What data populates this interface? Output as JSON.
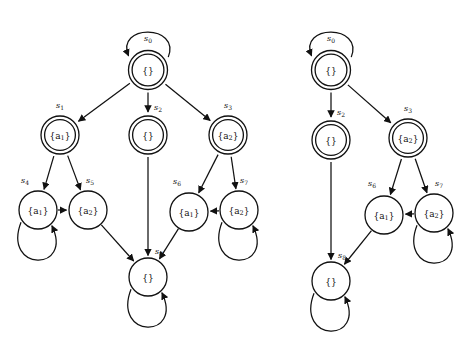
{
  "figure": {
    "title": "",
    "background_color": "#ffffff",
    "stroke_color": "#111111",
    "width": 472,
    "height": 339
  },
  "diagrams": [
    {
      "name": "left-automaton",
      "nodes": [
        {
          "id": "s0",
          "state_label": "s",
          "state_sub": "0",
          "set_label": "{}",
          "set_main": "{}",
          "set_sub": "",
          "cx": 148,
          "cy": 70,
          "r": 19.5,
          "double": true,
          "self_loop": "top",
          "state_label_x": 148,
          "state_label_y": 38
        },
        {
          "id": "s1",
          "state_label": "s",
          "state_sub": "1",
          "set_label": "{a1}",
          "set_main": "{a",
          "set_sub": "1",
          "cx": 60,
          "cy": 135,
          "r": 19,
          "double": true,
          "self_loop": "",
          "state_label_x": 60,
          "state_label_y": 105
        },
        {
          "id": "s2",
          "state_label": "s",
          "state_sub": "2",
          "set_label": "{}",
          "set_main": "{}",
          "set_sub": "",
          "cx": 148,
          "cy": 135,
          "r": 19,
          "double": true,
          "self_loop": "",
          "state_label_x": 158,
          "state_label_y": 107
        },
        {
          "id": "s3",
          "state_label": "s",
          "state_sub": "3",
          "set_label": "{a2}",
          "set_main": "{a",
          "set_sub": "2",
          "cx": 228,
          "cy": 135,
          "r": 19,
          "double": true,
          "self_loop": "",
          "state_label_x": 228,
          "state_label_y": 105
        },
        {
          "id": "s4",
          "state_label": "s",
          "state_sub": "4",
          "set_label": "{a1}",
          "set_main": "{a",
          "set_sub": "1",
          "cx": 38,
          "cy": 210,
          "r": 19,
          "double": false,
          "self_loop": "bottom",
          "state_label_x": 25,
          "state_label_y": 180
        },
        {
          "id": "s5",
          "state_label": "s",
          "state_sub": "5",
          "set_label": "{a2}",
          "set_main": "{a",
          "set_sub": "2",
          "cx": 88,
          "cy": 210,
          "r": 19,
          "double": false,
          "self_loop": "",
          "state_label_x": 90,
          "state_label_y": 180
        },
        {
          "id": "s6",
          "state_label": "s",
          "state_sub": "6",
          "set_label": "{a1}",
          "set_main": "{a",
          "set_sub": "1",
          "cx": 189,
          "cy": 212,
          "r": 19,
          "double": false,
          "self_loop": "",
          "state_label_x": 177,
          "state_label_y": 181
        },
        {
          "id": "s7",
          "state_label": "s",
          "state_sub": "7",
          "set_label": "{a2}",
          "set_main": "{a",
          "set_sub": "2",
          "cx": 239,
          "cy": 210,
          "r": 19,
          "double": false,
          "self_loop": "bottom",
          "state_label_x": 244,
          "state_label_y": 180
        },
        {
          "id": "s8",
          "state_label": "s",
          "state_sub": "8",
          "set_label": "{}",
          "set_main": "{}",
          "set_sub": "",
          "cx": 148,
          "cy": 277,
          "r": 19,
          "double": false,
          "self_loop": "bottom",
          "state_label_x": 159,
          "state_label_y": 251
        }
      ],
      "edges": [
        {
          "from": "s0",
          "to": "s1"
        },
        {
          "from": "s0",
          "to": "s2"
        },
        {
          "from": "s0",
          "to": "s3"
        },
        {
          "from": "s1",
          "to": "s4"
        },
        {
          "from": "s1",
          "to": "s5"
        },
        {
          "from": "s3",
          "to": "s6"
        },
        {
          "from": "s3",
          "to": "s7"
        },
        {
          "from": "s4",
          "to": "s5"
        },
        {
          "from": "s7",
          "to": "s6"
        },
        {
          "from": "s2",
          "to": "s8"
        },
        {
          "from": "s5",
          "to": "s8"
        },
        {
          "from": "s6",
          "to": "s8"
        }
      ]
    },
    {
      "name": "right-automaton",
      "nodes": [
        {
          "id": "s0",
          "state_label": "s",
          "state_sub": "0",
          "set_label": "{}",
          "set_main": "{}",
          "set_sub": "",
          "cx": 331,
          "cy": 70,
          "r": 19.5,
          "double": true,
          "self_loop": "top",
          "state_label_x": 331,
          "state_label_y": 38
        },
        {
          "id": "s2",
          "state_label": "s",
          "state_sub": "2",
          "set_label": "{}",
          "set_main": "{}",
          "set_sub": "",
          "cx": 331,
          "cy": 140,
          "r": 19,
          "double": true,
          "self_loop": "",
          "state_label_x": 341,
          "state_label_y": 112
        },
        {
          "id": "s3",
          "state_label": "s",
          "state_sub": "3",
          "set_label": "{a2}",
          "set_main": "{a",
          "set_sub": "2",
          "cx": 408,
          "cy": 138,
          "r": 19,
          "double": true,
          "self_loop": "",
          "state_label_x": 408,
          "state_label_y": 108
        },
        {
          "id": "s6",
          "state_label": "s",
          "state_sub": "6",
          "set_label": "{a1}",
          "set_main": "{a",
          "set_sub": "1",
          "cx": 384,
          "cy": 215,
          "r": 19,
          "double": false,
          "self_loop": "",
          "state_label_x": 372,
          "state_label_y": 183
        },
        {
          "id": "s7",
          "state_label": "s",
          "state_sub": "7",
          "set_label": "{a2}",
          "set_main": "{a",
          "set_sub": "2",
          "cx": 434,
          "cy": 213,
          "r": 19,
          "double": false,
          "self_loop": "bottom",
          "state_label_x": 439,
          "state_label_y": 183
        },
        {
          "id": "s8",
          "state_label": "s",
          "state_sub": "8",
          "set_label": "{}",
          "set_main": "{}",
          "set_sub": "",
          "cx": 331,
          "cy": 281,
          "r": 19,
          "double": false,
          "self_loop": "bottom",
          "state_label_x": 342,
          "state_label_y": 255
        }
      ],
      "edges": [
        {
          "from": "s0",
          "to": "s2"
        },
        {
          "from": "s0",
          "to": "s3"
        },
        {
          "from": "s3",
          "to": "s6"
        },
        {
          "from": "s3",
          "to": "s7"
        },
        {
          "from": "s7",
          "to": "s6"
        },
        {
          "from": "s2",
          "to": "s8"
        },
        {
          "from": "s6",
          "to": "s8"
        }
      ]
    }
  ]
}
